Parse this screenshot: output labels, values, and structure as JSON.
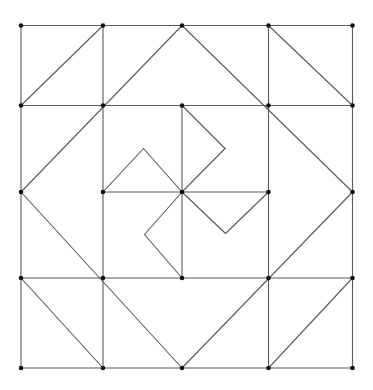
{
  "diagram": {
    "title": "",
    "kind": "quilt-pattern-geometric-construction",
    "colors": {
      "line": "#5a5a5a",
      "point": "#111111",
      "background": "#ffffff"
    },
    "grid": {
      "x": [
        21,
        103,
        182,
        268.5,
        352.5
      ],
      "y": [
        25.5,
        105.5,
        192,
        278,
        368
      ]
    },
    "segments": [
      {
        "name": "frame-top",
        "from": [
          21,
          25.5
        ],
        "to": [
          352.5,
          25.5
        ]
      },
      {
        "name": "frame-bottom",
        "from": [
          21,
          368
        ],
        "to": [
          352.5,
          368
        ]
      },
      {
        "name": "frame-left",
        "from": [
          21,
          25.5
        ],
        "to": [
          21,
          368
        ]
      },
      {
        "name": "frame-right",
        "from": [
          352.5,
          25.5
        ],
        "to": [
          352.5,
          368
        ]
      },
      {
        "name": "grid-h-row1",
        "from": [
          21,
          105.5
        ],
        "to": [
          352.5,
          105.5
        ]
      },
      {
        "name": "grid-h-row3",
        "from": [
          21,
          278
        ],
        "to": [
          352.5,
          278
        ]
      },
      {
        "name": "grid-v-col1",
        "from": [
          103,
          25.5
        ],
        "to": [
          103,
          368
        ]
      },
      {
        "name": "grid-v-col3",
        "from": [
          268.5,
          25.5
        ],
        "to": [
          268.5,
          368
        ]
      },
      {
        "name": "center-h",
        "from": [
          103,
          192
        ],
        "to": [
          268.5,
          192
        ]
      },
      {
        "name": "center-v",
        "from": [
          182,
          105.5
        ],
        "to": [
          182,
          278
        ]
      },
      {
        "name": "diag-topleft-cell",
        "from": [
          21,
          105.5
        ],
        "to": [
          103,
          25.5
        ]
      },
      {
        "name": "diag-topright-cell",
        "from": [
          268.5,
          25.5
        ],
        "to": [
          352.5,
          105.5
        ]
      },
      {
        "name": "diag-bottomleft-cell",
        "from": [
          21,
          278
        ],
        "to": [
          103,
          368
        ]
      },
      {
        "name": "diag-bottomright-cell",
        "from": [
          268.5,
          368
        ],
        "to": [
          352.5,
          278
        ]
      },
      {
        "name": "diamond-upper-left",
        "from": [
          21,
          192
        ],
        "to": [
          182,
          25.5
        ]
      },
      {
        "name": "diamond-upper-right",
        "from": [
          182,
          25.5
        ],
        "to": [
          352.5,
          192
        ]
      },
      {
        "name": "diamond-lower-right",
        "from": [
          352.5,
          192
        ],
        "to": [
          182,
          368
        ]
      },
      {
        "name": "diamond-lower-left",
        "from": [
          182,
          368
        ],
        "to": [
          21,
          192
        ]
      },
      {
        "name": "pinwheel-top-a",
        "from": [
          182,
          105.5
        ],
        "to": [
          225,
          148.5
        ]
      },
      {
        "name": "pinwheel-top-b",
        "from": [
          225,
          148.5
        ],
        "to": [
          182,
          192
        ]
      },
      {
        "name": "pinwheel-left-a",
        "from": [
          103,
          192
        ],
        "to": [
          143.5,
          148.5
        ]
      },
      {
        "name": "pinwheel-left-b",
        "from": [
          143.5,
          148.5
        ],
        "to": [
          182,
          192
        ]
      },
      {
        "name": "pinwheel-right-a",
        "from": [
          182,
          192
        ],
        "to": [
          225.5,
          233.5
        ]
      },
      {
        "name": "pinwheel-right-b",
        "from": [
          225.5,
          233.5
        ],
        "to": [
          268.5,
          192
        ]
      },
      {
        "name": "pinwheel-bottom-a",
        "from": [
          182,
          192
        ],
        "to": [
          144.5,
          234.5
        ]
      },
      {
        "name": "pinwheel-bottom-b",
        "from": [
          144.5,
          234.5
        ],
        "to": [
          182,
          278
        ]
      }
    ],
    "points": [
      [
        21,
        25.5
      ],
      [
        103,
        25.5
      ],
      [
        182,
        25.5
      ],
      [
        268.5,
        25.5
      ],
      [
        352.5,
        25.5
      ],
      [
        21,
        105.5
      ],
      [
        103,
        105.5
      ],
      [
        182,
        105.5
      ],
      [
        268.5,
        105.5
      ],
      [
        352.5,
        105.5
      ],
      [
        21,
        192
      ],
      [
        103,
        192
      ],
      [
        182,
        192
      ],
      [
        268.5,
        192
      ],
      [
        352.5,
        192
      ],
      [
        21,
        278
      ],
      [
        103,
        278
      ],
      [
        182,
        278
      ],
      [
        268.5,
        278
      ],
      [
        352.5,
        278
      ],
      [
        21,
        368
      ],
      [
        103,
        368
      ],
      [
        182,
        368
      ],
      [
        268.5,
        368
      ],
      [
        352.5,
        368
      ]
    ],
    "point_radius": 2.3
  }
}
